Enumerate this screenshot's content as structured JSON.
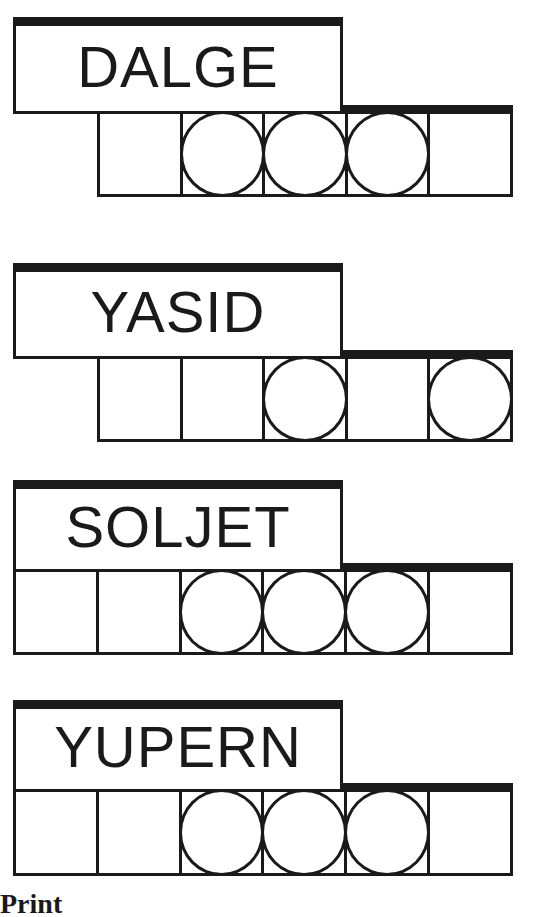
{
  "puzzles": [
    {
      "scrambled": "DALGE",
      "tile_count": 5,
      "circled": [
        2,
        3,
        4
      ],
      "top": 17,
      "label_height": 97,
      "tiles_left": 97,
      "tiles_top": 111,
      "tile_size": 86
    },
    {
      "scrambled": "YASID",
      "tile_count": 5,
      "circled": [
        3,
        5
      ],
      "top": 263,
      "label_height": 96,
      "tiles_left": 97,
      "tiles_top": 356,
      "tile_size": 86
    },
    {
      "scrambled": "SOLJET",
      "tile_count": 6,
      "circled": [
        3,
        4,
        5
      ],
      "top": 480,
      "label_height": 92,
      "tiles_left": 13,
      "tiles_top": 569,
      "tile_size": 86
    },
    {
      "scrambled": "YUPERN",
      "tile_count": 6,
      "circled": [
        3,
        4,
        5
      ],
      "top": 700,
      "label_height": 92,
      "tiles_left": 13,
      "tiles_top": 789,
      "tile_size": 87
    }
  ],
  "footer": {
    "partial_text": "Print"
  },
  "colors": {
    "ink": "#1a1a1a",
    "paper": "#ffffff"
  }
}
